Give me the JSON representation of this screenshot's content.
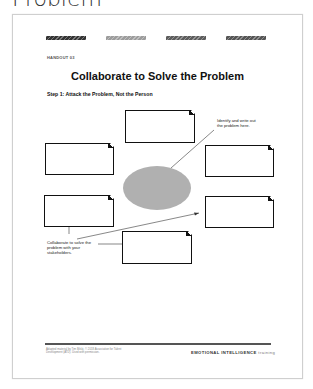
{
  "header": {
    "title": "Problem"
  },
  "handout": {
    "stripes": [
      {
        "color": "#333333",
        "left": 34
      },
      {
        "color": "#9a9a9a",
        "left": 94
      },
      {
        "color": "#5a5a5a",
        "left": 154
      },
      {
        "color": "#555555",
        "left": 214
      }
    ],
    "label": "HANDOUT 03",
    "title": "Collaborate to Solve the Problem",
    "step": "Step 1: Attack the Problem, Not the Person",
    "notes": {
      "identify": "Identify and write out the problem here.",
      "collaborate": "Collaborate to solve the problem with your stakeholders."
    },
    "footer": {
      "left": "Adapted material by Tim Bilski, © 2018 Association for Talent Development (ATD). Used with permission.",
      "brand_bold": "EMOTIONAL INTELLIGENCE",
      "brand_light": "training"
    }
  }
}
